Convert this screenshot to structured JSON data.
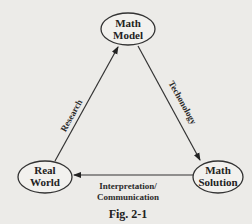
{
  "nodes": {
    "top": {
      "line1": "Math",
      "line2": "Model"
    },
    "left": {
      "line1": "Real",
      "line2": "World"
    },
    "right": {
      "line1": "Math",
      "line2": "Solution"
    }
  },
  "edges": {
    "research": {
      "label": "Research",
      "from": "Real World",
      "to": "Math Model"
    },
    "technology": {
      "label": "Techonology",
      "from": "Math Model",
      "to": "Math Solution"
    },
    "interpretation": {
      "line1": "Interpretation/",
      "line2": "Communication",
      "from": "Math Solution",
      "to": "Real World"
    }
  },
  "caption": "Fig. 2-1"
}
